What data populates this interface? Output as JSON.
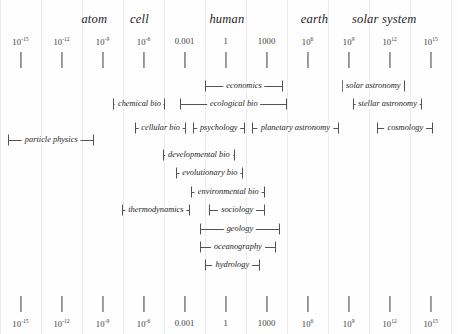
{
  "figure": {
    "background": "#fefefe",
    "gridline_color": "#eceaea",
    "ink_color": "#55524f"
  },
  "chart_data": {
    "type": "range-bar",
    "title": "",
    "xlabel": "",
    "ylabel": "",
    "scale": "log10",
    "xlim": [
      -16.5,
      17.0
    ],
    "grid": true,
    "legend": "none",
    "axis": {
      "position": "top-and-bottom",
      "tick_exponents": [
        -15,
        -12,
        -9,
        -6,
        -3,
        0,
        3,
        6,
        9,
        12,
        15
      ],
      "tick_labels": [
        {
          "mantissa": "10",
          "exponent": "-15",
          "plain": "10^-15"
        },
        {
          "mantissa": "10",
          "exponent": "-12",
          "plain": "10^-12"
        },
        {
          "mantissa": "10",
          "exponent": "-9",
          "plain": "10^-9"
        },
        {
          "mantissa": "10",
          "exponent": "-6",
          "plain": "10^-6"
        },
        {
          "mantissa": "0.001",
          "exponent": "",
          "plain": "0.001"
        },
        {
          "mantissa": "1",
          "exponent": "",
          "plain": "1"
        },
        {
          "mantissa": "1000",
          "exponent": "",
          "plain": "1000"
        },
        {
          "mantissa": "10",
          "exponent": "6",
          "plain": "10^6"
        },
        {
          "mantissa": "10",
          "exponent": "9",
          "plain": "10^9"
        },
        {
          "mantissa": "10",
          "exponent": "12",
          "plain": "10^12"
        },
        {
          "mantissa": "10",
          "exponent": "15",
          "plain": "10^15"
        }
      ],
      "extra_tick_exponent": 18
    },
    "scale_markers": [
      {
        "label": "atom",
        "exponent": -9.6
      },
      {
        "label": "cell",
        "exponent": -6.3
      },
      {
        "label": "human",
        "exponent": 0.1
      },
      {
        "label": "earth",
        "exponent": 6.5
      },
      {
        "label": "solar system",
        "exponent": 11.6
      }
    ],
    "ranges": [
      {
        "label": "economics",
        "row": 1,
        "start": -1.5,
        "end": 4.2
      },
      {
        "label": "solar astronomy",
        "row": 1,
        "start": 8.5,
        "end": 13.1
      },
      {
        "label": "chemical bio",
        "row": 2,
        "start": -8.2,
        "end": -4.4
      },
      {
        "label": "ecological bio",
        "row": 2,
        "start": -3.3,
        "end": 4.5
      },
      {
        "label": "stellar astronomy",
        "row": 2,
        "start": 9.3,
        "end": 14.4
      },
      {
        "label": "cellular bio",
        "row": 3,
        "start": -6.6,
        "end": -2.9
      },
      {
        "label": "psychology",
        "row": 3,
        "start": -2.4,
        "end": 1.4
      },
      {
        "label": "planetary astronomy",
        "row": 3,
        "start": 1.9,
        "end": 8.3
      },
      {
        "label": "cosmology",
        "row": 3,
        "start": 11.1,
        "end": 15.2
      },
      {
        "label": "particle physics",
        "row": 4,
        "start": -15.9,
        "end": -9.6
      },
      {
        "label": "developmental bio",
        "row": 5,
        "start": -4.6,
        "end": 0.7
      },
      {
        "label": "evolutionary bio",
        "row": 6,
        "start": -3.6,
        "end": 1.3
      },
      {
        "label": "environmental bio",
        "row": 7,
        "start": -2.5,
        "end": 2.9
      },
      {
        "label": "thermodynamics",
        "row": 8,
        "start": -7.6,
        "end": -2.6
      },
      {
        "label": "sociology",
        "row": 8,
        "start": -1.2,
        "end": 2.9
      },
      {
        "label": "geology",
        "row": 9,
        "start": -1.9,
        "end": 4.0
      },
      {
        "label": "oceanography",
        "row": 10,
        "start": -1.9,
        "end": 3.7
      },
      {
        "label": "hydrology",
        "row": 11,
        "start": -1.5,
        "end": 2.5
      }
    ]
  }
}
